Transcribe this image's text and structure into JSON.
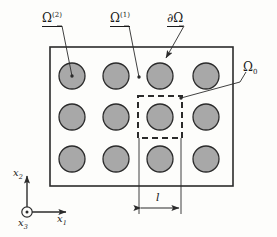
{
  "figure": {
    "type": "technical-diagram",
    "labels": {
      "omega_2": {
        "base": "Ω",
        "sup": "(2)",
        "text": "Ω(2)"
      },
      "omega_1": {
        "base": "Ω",
        "sup": "(1)",
        "text": "Ω(1)"
      },
      "boundary": {
        "text": "∂Ω"
      },
      "unit_cell": {
        "base": "Ω",
        "sub": "0",
        "text": "Ω0"
      },
      "length": {
        "text": "l"
      }
    },
    "axes": {
      "x1": {
        "base": "x",
        "sub": "1",
        "text": "x1"
      },
      "x2": {
        "base": "x",
        "sub": "2",
        "text": "x2"
      },
      "x3": {
        "base": "x",
        "sub": "3",
        "text": "x3"
      }
    },
    "colors": {
      "inclusion_fill": "#a8a8a8",
      "inclusion_stroke": "#2b2b2b",
      "domain_stroke": "#2b2b2b",
      "background": "#fdfdfb",
      "leader": "#2b2b2b"
    },
    "geometry": {
      "domain_rect": {
        "x": 50,
        "y": 47,
        "width": 183,
        "height": 139
      },
      "grid": {
        "columns": 4,
        "rows": 3,
        "total_inclusions": 12
      },
      "inclusion_radius": 13,
      "column_centers_x": [
        72,
        116,
        160,
        206
      ],
      "row_centers_y": [
        76,
        117,
        159
      ],
      "unit_cell_rect": {
        "x": 138,
        "y": 96,
        "width": 44,
        "height": 42
      },
      "dimension_line_y": 208
    }
  }
}
